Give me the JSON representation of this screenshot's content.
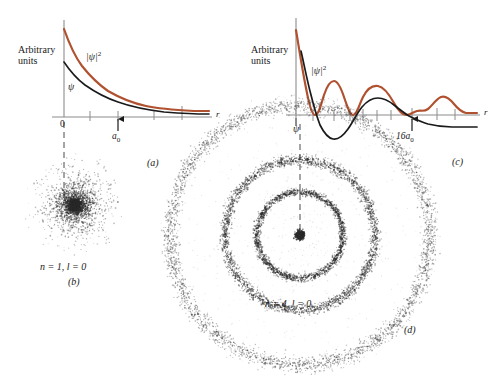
{
  "figure": {
    "colors": {
      "psi_curve": "#1a1a1a",
      "psi_squared_curve": "#b0512f",
      "axis": "#8c8c8c",
      "dots": "#2b2b2b",
      "background": "#ffffff"
    }
  },
  "panels": {
    "a": {
      "letter": "(a)",
      "y_axis_label_line1": "Arbitrary",
      "y_axis_label_line2": "units",
      "x_axis_label": "r",
      "origin_label": "0",
      "psi_label": "ψ",
      "psi_squared_label_base": "|ψ|",
      "psi_squared_label_exp": "2",
      "marker_label_base": "a",
      "marker_label_sub": "0",
      "marker_arrow": "up-arrow"
    },
    "b": {
      "letter": "(b)",
      "caption_n": "n = 1",
      "caption_l": "l = 0",
      "caption": "n = 1, l = 0"
    },
    "c": {
      "letter": "(c)",
      "y_axis_label_line1": "Arbitrary",
      "y_axis_label_line2": "units",
      "x_axis_label": "r",
      "psi_label": "ψ",
      "psi_squared_label_base": "|ψ|",
      "psi_squared_label_exp": "2",
      "marker_label_base": "16a",
      "marker_label_sub": "0",
      "marker_arrow": "up-arrow"
    },
    "d": {
      "letter": "(d)",
      "caption_n": "n = 4",
      "caption_l": "l = 0",
      "caption": "n = 4, l = 0"
    }
  },
  "chart_data": [
    {
      "type": "line",
      "id": "panel-a",
      "title": "",
      "xlabel": "r",
      "ylabel": "Arbitrary units",
      "xlim": [
        0,
        6
      ],
      "ylim": [
        0,
        1
      ],
      "grid": false,
      "legend": "inline-annotations",
      "annotations": [
        {
          "text": "|ψ|^2",
          "x": 1.1,
          "y": 0.68
        },
        {
          "text": "ψ",
          "x": 0.35,
          "y": 0.33
        },
        {
          "text": "a_0",
          "x": 1.6,
          "y": -0.13,
          "arrow": "up"
        }
      ],
      "x_ticks": [
        0,
        0.9,
        1.6,
        3.1,
        4.2
      ],
      "x_tick_labels": [
        "0",
        "",
        "",
        "",
        ""
      ],
      "series": [
        {
          "name": "psi",
          "color": "#1a1a1a",
          "x": [
            0.0,
            0.3,
            0.6,
            0.9,
            1.2,
            1.6,
            2.0,
            2.5,
            3.1,
            3.7,
            4.3,
            5.0,
            6.0
          ],
          "y": [
            0.56,
            0.47,
            0.4,
            0.34,
            0.285,
            0.235,
            0.195,
            0.155,
            0.122,
            0.1,
            0.086,
            0.076,
            0.068
          ]
        },
        {
          "name": "psi_squared",
          "color": "#b0512f",
          "x": [
            0.0,
            0.3,
            0.6,
            0.9,
            1.2,
            1.6,
            2.0,
            2.5,
            3.1,
            3.7,
            4.3,
            5.0,
            6.0
          ],
          "y": [
            0.98,
            0.8,
            0.66,
            0.555,
            0.47,
            0.385,
            0.325,
            0.265,
            0.215,
            0.185,
            0.163,
            0.15,
            0.142
          ]
        }
      ]
    },
    {
      "type": "line",
      "id": "panel-c",
      "title": "",
      "xlabel": "r",
      "ylabel": "Arbitrary units",
      "xlim": [
        0,
        26
      ],
      "ylim": [
        -0.55,
        1.0
      ],
      "grid": false,
      "legend": "inline-annotations",
      "annotations": [
        {
          "text": "|ψ|^2",
          "x": 3.2,
          "y": 0.62
        },
        {
          "text": "ψ",
          "x": 0.9,
          "y": -0.24
        },
        {
          "text": "16a_0",
          "x": 16.0,
          "y": -0.3,
          "arrow": "up"
        }
      ],
      "x_ticks": [
        2.2,
        5.0,
        7.2,
        9.0,
        11.0,
        13.0,
        16.0,
        19.5,
        22.0,
        24.5
      ],
      "x_tick_labels": [
        "",
        "",
        "",
        "",
        "",
        "",
        "",
        "",
        "",
        ""
      ],
      "series": [
        {
          "name": "psi",
          "color": "#1a1a1a",
          "x": [
            0.6,
            1.2,
            2.0,
            2.8,
            3.6,
            4.4,
            5.2,
            6.2,
            7.2,
            8.4,
            9.6,
            11.0,
            12.5,
            14.0,
            15.5,
            17.0,
            18.5,
            20.0,
            22.0,
            24.0,
            26.0
          ],
          "y": [
            0.48,
            0.22,
            -0.05,
            -0.26,
            -0.385,
            -0.43,
            -0.4,
            -0.3,
            -0.16,
            -0.02,
            0.09,
            0.145,
            0.145,
            0.115,
            0.065,
            0.015,
            -0.035,
            -0.07,
            -0.095,
            -0.1,
            -0.1
          ]
        },
        {
          "name": "psi_squared",
          "color": "#b0512f",
          "x": [
            0.2,
            0.7,
            1.4,
            2.2,
            3.0,
            3.8,
            4.6,
            5.4,
            6.2,
            7.2,
            8.2,
            9.2,
            10.4,
            11.6,
            13.0,
            14.4,
            15.8,
            17.2,
            18.6,
            20.0,
            21.4,
            22.8,
            24.2,
            26.0
          ],
          "y": [
            0.94,
            0.6,
            0.18,
            0.01,
            0.1,
            0.3,
            0.38,
            0.3,
            0.1,
            0.012,
            0.1,
            0.235,
            0.3,
            0.26,
            0.13,
            0.04,
            0.008,
            0.035,
            0.115,
            0.155,
            0.12,
            0.075,
            0.062,
            0.058
          ]
        }
      ]
    },
    {
      "type": "scatter",
      "id": "panel-b",
      "title": "n = 1, l = 0",
      "description": "Electron probability cloud: single dense central concentration decaying outward",
      "center": [
        75,
        205
      ],
      "shells": [
        {
          "radius": 0,
          "density": "high"
        }
      ],
      "max_radius": 52
    },
    {
      "type": "scatter",
      "id": "panel-d",
      "title": "n = 4, l = 0",
      "description": "Electron probability cloud: dense core plus three concentric rings",
      "center": [
        300,
        235
      ],
      "shells": [
        {
          "radius": 0,
          "density": "high"
        },
        {
          "radius": 43,
          "density": "medium"
        },
        {
          "radius": 75,
          "density": "medium"
        },
        {
          "radius": 130,
          "density": "low"
        }
      ],
      "max_radius": 140
    }
  ]
}
